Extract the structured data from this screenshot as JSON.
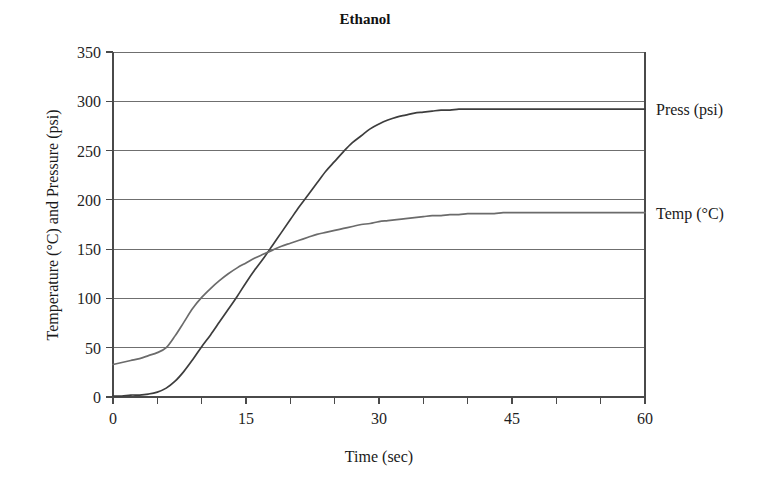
{
  "chart_data": {
    "type": "line",
    "title": "Ethanol",
    "xlabel": "Time (sec)",
    "ylabel": "Temperature (°C) and Pressure (psi)",
    "xlim": [
      0,
      60
    ],
    "ylim": [
      0,
      350
    ],
    "xticks": [
      0,
      15,
      30,
      45,
      60
    ],
    "xtick_labels": [
      "0",
      "15",
      "30",
      "45",
      "60"
    ],
    "xminor_step": 5,
    "yticks": [
      0,
      50,
      100,
      150,
      200,
      250,
      300,
      350
    ],
    "ytick_labels": [
      "0",
      "50",
      "100",
      "150",
      "200",
      "250",
      "300",
      "350"
    ],
    "grid": "horizontal",
    "legend_position": "right-of-axes-inline",
    "x": [
      0,
      1,
      2,
      3,
      4,
      5,
      6,
      7,
      8,
      9,
      10,
      11,
      12,
      13,
      14,
      15,
      16,
      17,
      18,
      19,
      20,
      21,
      22,
      23,
      24,
      25,
      26,
      27,
      28,
      29,
      30,
      31,
      32,
      33,
      34,
      35,
      36,
      37,
      38,
      39,
      40,
      41,
      42,
      43,
      44,
      45,
      46,
      47,
      48,
      49,
      50,
      51,
      52,
      53,
      54,
      55,
      56,
      57,
      58,
      59,
      60
    ],
    "series": [
      {
        "name": "Press (psi)",
        "color": "#3d3d3d",
        "label": "Press (psi)",
        "label_value": 292,
        "values": [
          1,
          1,
          2,
          2,
          3,
          5,
          9,
          16,
          26,
          38,
          51,
          63,
          76,
          89,
          102,
          116,
          129,
          141,
          154,
          167,
          180,
          193,
          205,
          217,
          229,
          239,
          249,
          258,
          265,
          272,
          277,
          281,
          284,
          286,
          288,
          289,
          290,
          291,
          291,
          292,
          292,
          292,
          292,
          292,
          292,
          292,
          292,
          292,
          292,
          292,
          292,
          292,
          292,
          292,
          292,
          292,
          292,
          292,
          292,
          292,
          292
        ]
      },
      {
        "name": "Temp (°C)",
        "color": "#6b6b6b",
        "label": "Temp (°C)",
        "label_value": 187,
        "values": [
          33,
          35,
          37,
          39,
          42,
          45,
          50,
          62,
          76,
          90,
          101,
          110,
          118,
          125,
          131,
          136,
          141,
          145,
          149,
          153,
          156,
          159,
          162,
          165,
          167,
          169,
          171,
          173,
          175,
          176,
          178,
          179,
          180,
          181,
          182,
          183,
          184,
          184,
          185,
          185,
          186,
          186,
          186,
          186,
          187,
          187,
          187,
          187,
          187,
          187,
          187,
          187,
          187,
          187,
          187,
          187,
          187,
          187,
          187,
          187,
          187
        ]
      }
    ],
    "crossover": {
      "x": 18.4,
      "y": 151
    }
  },
  "layout": {
    "plot_left": 113,
    "plot_right": 645,
    "plot_top": 52,
    "plot_bottom": 397,
    "title_x": 365,
    "title_y": 24
  }
}
